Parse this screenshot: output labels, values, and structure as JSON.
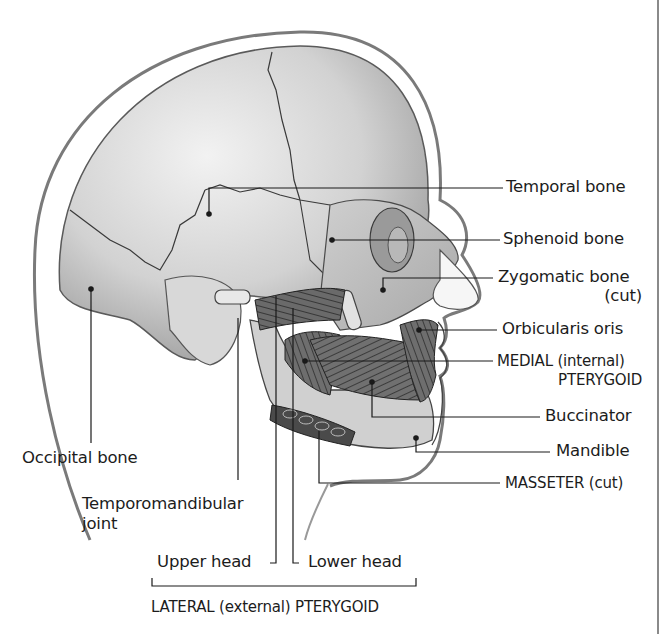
{
  "figure": {
    "colors": {
      "background": "#ffffff",
      "ink": "#1c1c1c",
      "skull_light": "#e6e6e6",
      "skull_mid": "#bdbdbd",
      "skull_dark": "#8c8c8c",
      "muscle": "#5a5a5a",
      "frame": "#8a8a8a"
    }
  },
  "labels": {
    "temporal_bone": "Temporal bone",
    "sphenoid_bone": "Sphenoid bone",
    "zygomatic_bone": "Zygomatic bone",
    "zygomatic_bone_note": "(cut)",
    "orbicularis_oris": "Orbicularis oris",
    "medial_pterygoid_line1": "MEDIAL (internal)",
    "medial_pterygoid_line2": "PTERYGOID",
    "buccinator": "Buccinator",
    "mandible": "Mandible",
    "masseter": "MASSETER (cut)",
    "occipital_bone": "Occipital bone",
    "tmj_line1": "Temporomandibular",
    "tmj_line2": "joint",
    "upper_head": "Upper head",
    "lower_head": "Lower head",
    "lateral_pterygoid": "LATERAL  (external)  PTERYGOID"
  }
}
